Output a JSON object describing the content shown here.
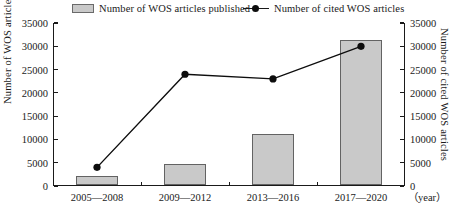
{
  "chart_data": {
    "type": "bar",
    "title": "",
    "subtitle": "",
    "categories": [
      "2005—2008",
      "2009—2012",
      "2013—2016",
      "2017—2020"
    ],
    "xlabel": "",
    "x_unit_label": "（year）",
    "ylabel": "Number of WOS articles published",
    "y2label": "Number of cited WOS  articles",
    "ylim": [
      0,
      35000
    ],
    "y2lim": [
      0,
      35000
    ],
    "yticks": [
      0,
      5000,
      10000,
      15000,
      20000,
      25000,
      30000,
      35000
    ],
    "y2ticks": [
      0,
      5000,
      10000,
      15000,
      20000,
      25000,
      30000,
      35000
    ],
    "ytick_labels": [
      "0",
      "5000",
      "10000",
      "15000",
      "20000",
      "25000",
      "30000",
      "35000"
    ],
    "y2tick_labels": [
      "0",
      "5000",
      "10000",
      "15000",
      "20000",
      "25000",
      "30000",
      "35000"
    ],
    "grid": false,
    "legend_position": "top",
    "series": [
      {
        "name": "Number of WOS articles published",
        "type": "bar",
        "axis": "left",
        "color": "#c9c9c9",
        "edge_color": "#636363",
        "values": [
          2000,
          4500,
          11000,
          31000
        ]
      },
      {
        "name": "Number of  cited WOS articles",
        "type": "line",
        "axis": "right",
        "color": "#0d0d0d",
        "marker": "circle",
        "values": [
          4000,
          24000,
          23000,
          30000
        ]
      }
    ]
  },
  "legend": {
    "entries": [
      {
        "label": "Number of WOS articles published",
        "swatch": "bar-swatch"
      },
      {
        "label": "Number of  cited WOS articles",
        "swatch": "line-marker-swatch"
      }
    ]
  },
  "colors": {
    "bar_fill": "#c9c9c9",
    "bar_edge": "#636363",
    "line": "#0d0d0d",
    "axis": "#1a1a1a",
    "background": "#ffffff"
  }
}
